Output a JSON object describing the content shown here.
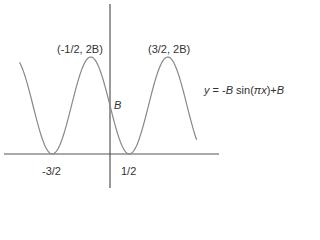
{
  "chart_data": {
    "type": "line",
    "title": "",
    "equation": "y = -B sin(πx)+B",
    "xlabel": "",
    "ylabel": "",
    "x_ticks": [
      "-3/2",
      "1/2"
    ],
    "annotations": [
      {
        "point": "(-1/2, 2B)",
        "x": -0.5,
        "y": "2B"
      },
      {
        "point": "(3/2, 2B)",
        "x": 1.5,
        "y": "2B"
      },
      {
        "point": "B",
        "x": 0,
        "y": "B"
      }
    ],
    "series": [
      {
        "name": "y = -B sin(πx)+B",
        "function": "-B*sin(pi*x)+B",
        "x_range": [
          -2.35,
          2.25
        ]
      }
    ],
    "grid": false,
    "legend": "none"
  },
  "labels": {
    "peak_left": "(-1/2, 2B)",
    "peak_right": "(3/2, 2B)",
    "b_marker": "B",
    "tick_neg": "-3/2",
    "tick_pos": "1/2",
    "eq_y": "y",
    "eq_eq": " = -",
    "eq_B1": "B",
    "eq_sin": " sin(",
    "eq_pi": "π",
    "eq_x": "x",
    "eq_rest": ")+",
    "eq_B2": "B"
  },
  "colors": {
    "axis": "#555555",
    "curve": "#888888",
    "text": "#333333"
  }
}
